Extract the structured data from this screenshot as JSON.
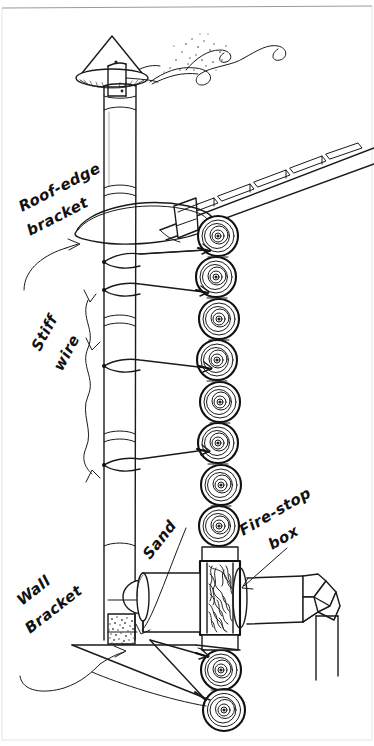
{
  "figure": {
    "medium": "hand-drawn pen-and-ink sketch",
    "background_color": "#ffffff",
    "ink_color": "#1a1a1a",
    "border_color": "#9a9a9a",
    "width": 374,
    "height": 746
  },
  "labels": [
    {
      "id": "roof-edge-bracket",
      "line1": "Roof-edge",
      "line2": "bracket",
      "x": 22,
      "y": 205,
      "rotation": -27,
      "pointer": "curved-arrow",
      "points_to": "bracket-collar"
    },
    {
      "id": "stiff-wire",
      "line1": "Stiff",
      "line2": "wire",
      "x": 36,
      "y": 362,
      "rotation": -62,
      "pointer": "double-curved-arrow",
      "points_to": "guy-wires"
    },
    {
      "id": "sand",
      "line1": "Sand",
      "line2": "",
      "x": 150,
      "y": 545,
      "rotation": -52,
      "pointer": "curved-arrow",
      "points_to": "sand-fill"
    },
    {
      "id": "fire-stop-box",
      "line1": "Fire-stop",
      "line2": "box",
      "x": 246,
      "y": 520,
      "rotation": -30,
      "pointer": "straight-arrow",
      "points_to": "firestop-box"
    },
    {
      "id": "wall-bracket",
      "line1": "Wall",
      "line2": "Bracket",
      "x": 24,
      "y": 600,
      "rotation": -38,
      "pointer": "branching-arrow",
      "points_to": "base-plate"
    }
  ],
  "parts": {
    "rain_cap": {
      "name": "conical rain cap",
      "shape": "cone",
      "has_strap_bracket": true
    },
    "flue_pipe": {
      "name": "vertical flue pipe",
      "sections": 5,
      "joints": 4
    },
    "smoke": {
      "name": "smoke curls",
      "curls": 3,
      "has_spark_stipple": true
    },
    "roof": {
      "name": "sloped roof edge",
      "shingle_count": 5,
      "slope": "down-to-left",
      "has_flashing_collar": true
    },
    "log_wall": {
      "name": "cordwood log-end wall",
      "log_count": 13,
      "pattern": "concentric tree rings"
    },
    "guy_wires": {
      "name": "stiff guy wires",
      "count": 4,
      "attachment": "flue pipe to log wall"
    },
    "bracket_collar": {
      "name": "roof-edge bracket hoop",
      "shape": "ellipse ring"
    },
    "firestop_box": {
      "name": "fire-stop box",
      "fill": "insulation hatching",
      "has_top_flange": true,
      "has_bottom_flange": true
    },
    "thimble": {
      "name": "wall thimble / clean-out tee",
      "has_domed_cap": true
    },
    "horizontal_pipe": {
      "name": "horizontal stove pipe"
    },
    "elbow": {
      "name": "gored elbow",
      "segments": 4,
      "turn": "90 degrees down"
    },
    "sand_fill": {
      "name": "sand fill at flue base",
      "texture": "stipple"
    },
    "base_plate": {
      "name": "wall bracket base plate / floor line"
    }
  }
}
